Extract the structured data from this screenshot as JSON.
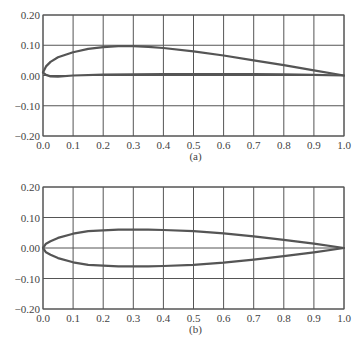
{
  "chart_data": [
    {
      "type": "line",
      "caption": "(a)",
      "title": "",
      "xlabel": "",
      "ylabel": "",
      "xlim": [
        0.0,
        1.0
      ],
      "ylim": [
        -0.2,
        0.2
      ],
      "grid": true,
      "legend": null,
      "x_ticks": [
        "0.0",
        "0.1",
        "0.2",
        "0.3",
        "0.4",
        "0.5",
        "0.6",
        "0.7",
        "0.8",
        "0.9",
        "1.0"
      ],
      "y_ticks": [
        "0.20",
        "0.10",
        "0.00",
        "−0.10",
        "−0.20"
      ],
      "series": [
        {
          "name": "upper surface",
          "x": [
            0.0,
            0.01,
            0.025,
            0.05,
            0.1,
            0.15,
            0.2,
            0.25,
            0.3,
            0.35,
            0.4,
            0.5,
            0.6,
            0.7,
            0.8,
            0.9,
            1.0
          ],
          "y": [
            0.01,
            0.03,
            0.045,
            0.06,
            0.077,
            0.088,
            0.094,
            0.097,
            0.097,
            0.095,
            0.091,
            0.08,
            0.066,
            0.05,
            0.034,
            0.017,
            0.0
          ]
        },
        {
          "name": "lower surface",
          "x": [
            0.0,
            0.01,
            0.025,
            0.05,
            0.1,
            0.2,
            0.3,
            0.4,
            0.5,
            0.6,
            0.7,
            0.8,
            0.9,
            1.0
          ],
          "y": [
            0.01,
            0.002,
            -0.003,
            -0.004,
            0.0,
            0.003,
            0.004,
            0.005,
            0.005,
            0.005,
            0.005,
            0.004,
            0.002,
            0.0
          ]
        }
      ]
    },
    {
      "type": "line",
      "caption": "(b)",
      "title": "",
      "xlabel": "",
      "ylabel": "",
      "xlim": [
        0.0,
        1.0
      ],
      "ylim": [
        -0.2,
        0.2
      ],
      "grid": true,
      "legend": null,
      "x_ticks": [
        "0.0",
        "0.1",
        "0.2",
        "0.3",
        "0.4",
        "0.5",
        "0.6",
        "0.7",
        "0.8",
        "0.9",
        "1.0"
      ],
      "y_ticks": [
        "0.20",
        "0.10",
        "0.00",
        "−0.10",
        "−0.20"
      ],
      "series": [
        {
          "name": "upper surface",
          "x": [
            0.0,
            0.01,
            0.025,
            0.05,
            0.1,
            0.15,
            0.2,
            0.25,
            0.3,
            0.35,
            0.4,
            0.5,
            0.6,
            0.7,
            0.8,
            0.9,
            1.0
          ],
          "y": [
            0.0,
            0.014,
            0.022,
            0.033,
            0.047,
            0.055,
            0.058,
            0.06,
            0.06,
            0.06,
            0.059,
            0.055,
            0.048,
            0.038,
            0.027,
            0.014,
            0.0
          ]
        },
        {
          "name": "lower surface",
          "x": [
            0.0,
            0.01,
            0.025,
            0.05,
            0.1,
            0.15,
            0.2,
            0.25,
            0.3,
            0.35,
            0.4,
            0.5,
            0.6,
            0.7,
            0.8,
            0.9,
            1.0
          ],
          "y": [
            0.0,
            -0.014,
            -0.022,
            -0.033,
            -0.047,
            -0.055,
            -0.058,
            -0.06,
            -0.06,
            -0.06,
            -0.059,
            -0.055,
            -0.048,
            -0.038,
            -0.027,
            -0.014,
            0.0
          ]
        }
      ]
    }
  ],
  "style": {
    "grid_color": "#555555",
    "curve_color": "#555555",
    "text_color": "#444444"
  }
}
